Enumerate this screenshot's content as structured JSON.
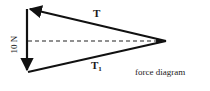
{
  "diagram": {
    "caption": "force diagram",
    "labels": {
      "top_vector": "T",
      "bottom_vector_main": "T",
      "bottom_vector_sub": "1",
      "vertical_vector": "10 N"
    },
    "colors": {
      "stroke": "#111111",
      "background": "#ffffff"
    },
    "geometry": {
      "top_left": [
        27,
        8
      ],
      "bottom_left": [
        28,
        72
      ],
      "right_vertex": [
        166,
        41
      ],
      "dashed_y": 41
    }
  }
}
